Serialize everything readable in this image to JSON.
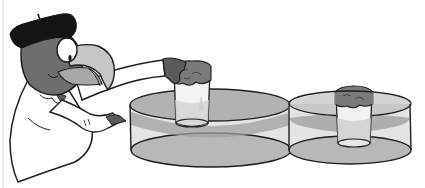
{
  "figure": {
    "description": "Cartoon parrot scientist in beret and lab coat pressing an inverted cup down into a basin of water; second basin shows the cup fully lowered with the paper inside staying dry",
    "colors": {
      "background": "#ffffff",
      "outline": "#1e1e1e",
      "beret": "#141414",
      "head": "#6e6e6e",
      "beak": "#c4c4c4",
      "beak_lower": "#a8a8a8",
      "eye": "#ffffff",
      "coat": "#ffffff",
      "hand": "#5a5a5a",
      "water_top": "#a9a9a9",
      "water_side": "#dcdcdc",
      "water_band": "#9a9a9a",
      "basin_bottom": "#b8b8b8",
      "cup": "#f2f2f2",
      "paper": "#7a7a7a",
      "border": "#d0d0d0"
    },
    "panels": [
      {
        "name": "pressing-cup-into-water",
        "character": "parrot-scientist",
        "objects": [
          "beret",
          "lab-coat",
          "inverted-cup",
          "crumpled-paper",
          "water-basin"
        ]
      },
      {
        "name": "cup-submerged",
        "objects": [
          "inverted-cup",
          "crumpled-paper",
          "water-basin"
        ]
      }
    ]
  }
}
